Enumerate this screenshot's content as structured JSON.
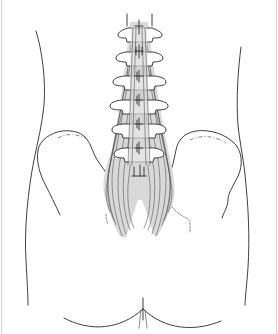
{
  "illustration": {
    "subject": "posterior view of lower back: lumbar spine, pelvis (iliac crests), erector spinae / multifidus muscles, gluteal cleft",
    "style": "black line drawing with light gray muscle fill on white",
    "colors": {
      "background": "#ffffff",
      "line": "#2a2a2a",
      "muscle_fill": "#d9d9d9",
      "frame_edge": "#d6d6d6"
    },
    "vertebrae_count": 6,
    "labels": []
  }
}
